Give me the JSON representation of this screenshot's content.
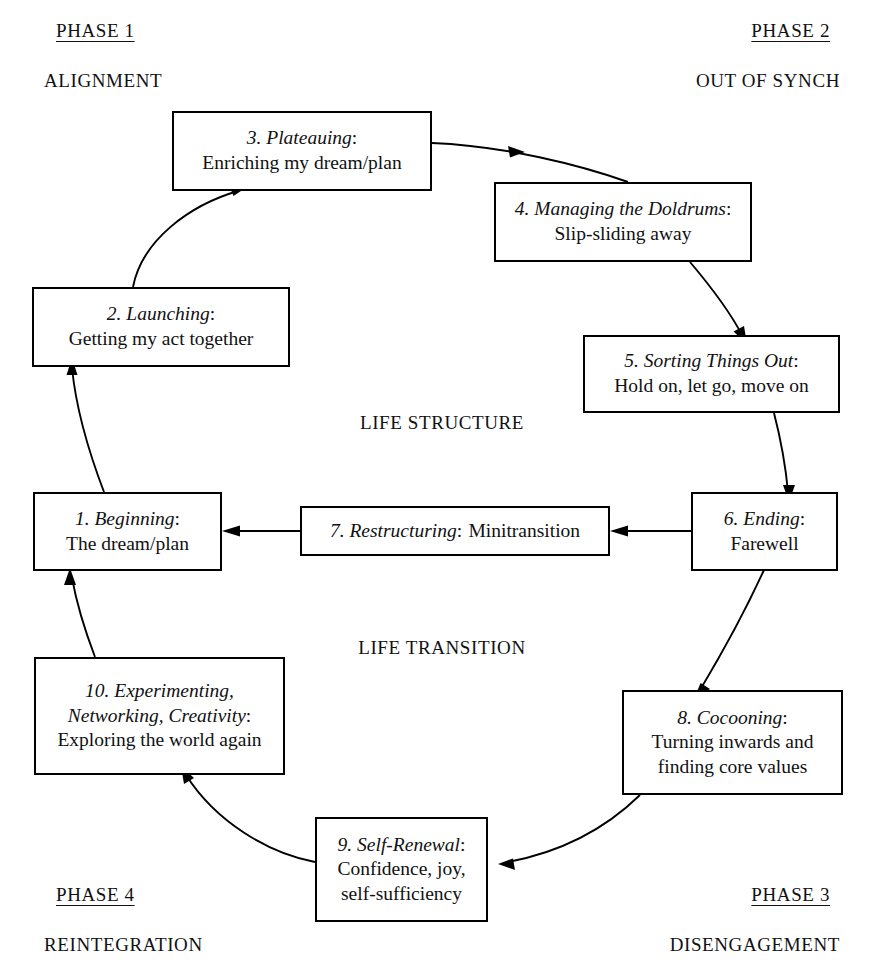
{
  "phases": [
    {
      "key": "phase1",
      "title": "PHASE 1",
      "subtitle": "ALIGNMENT"
    },
    {
      "key": "phase2",
      "title": "PHASE 2",
      "subtitle": "OUT OF SYNCH"
    },
    {
      "key": "phase3",
      "title": "PHASE 3",
      "subtitle": "DISENGAGEMENT"
    },
    {
      "key": "phase4",
      "title": "PHASE 4",
      "subtitle": "REINTEGRATION"
    }
  ],
  "centre_labels": {
    "structure": "LIFE STRUCTURE",
    "transition": "LIFE TRANSITION"
  },
  "stages": [
    {
      "num": "1.",
      "title": "Beginning",
      "colon": ":",
      "lines": [
        "The dream/plan"
      ]
    },
    {
      "num": "2.",
      "title": "Launching",
      "colon": ":",
      "lines": [
        "Getting my act together"
      ]
    },
    {
      "num": "3.",
      "title": "Plateauing",
      "colon": ":",
      "lines": [
        "Enriching my dream/plan"
      ]
    },
    {
      "num": "4.",
      "title": "Managing the Doldrums",
      "colon": ":",
      "lines": [
        "Slip-sliding away"
      ]
    },
    {
      "num": "5.",
      "title": "Sorting Things Out",
      "colon": ":",
      "lines": [
        "Hold on, let go, move on"
      ]
    },
    {
      "num": "6.",
      "title": "Ending",
      "colon": ":",
      "lines": [
        "Farewell"
      ]
    },
    {
      "num": "7.",
      "title": "Restructuring",
      "colon": ":",
      "lines": [
        "Minitransition"
      ]
    },
    {
      "num": "8.",
      "title": "Cocooning",
      "colon": ":",
      "lines": [
        "Turning inwards and",
        "finding core values"
      ]
    },
    {
      "num": "9.",
      "title": "Self-Renewal",
      "colon": ":",
      "lines": [
        "Confidence, joy,",
        "self-sufficiency"
      ]
    },
    {
      "num": "10.",
      "title": "Experimenting,",
      "title2": "Networking, Creativity",
      "colon": ":",
      "lines": [
        "Exploring the world again"
      ]
    }
  ],
  "colors": {
    "ink": "#000000",
    "paper": "#ffffff"
  }
}
